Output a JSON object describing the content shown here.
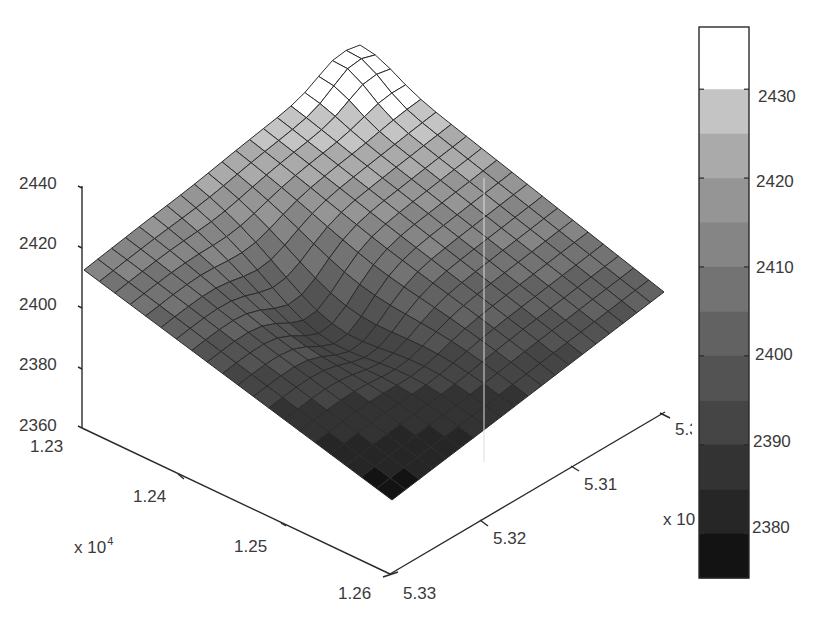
{
  "chart_data": {
    "type": "surface3d",
    "title": "",
    "xlabel": "",
    "ylabel": "",
    "zlabel": "",
    "x_axis": {
      "ticks": [
        "1.23",
        "1.24",
        "1.25",
        "1.26"
      ],
      "multiplier": "x 10",
      "exponent": "4",
      "range": [
        12300,
        12600
      ]
    },
    "y_axis": {
      "ticks": [
        "5.3",
        "5.31",
        "5.32",
        "5.33"
      ],
      "multiplier": "x 10",
      "exponent": "",
      "range": [
        5.3,
        5.33
      ]
    },
    "z_axis": {
      "ticks": [
        "2360",
        "2380",
        "2400",
        "2420",
        "2440"
      ],
      "range": [
        2360,
        2440
      ]
    },
    "colorbar": {
      "ticks": [
        "2430",
        "2420",
        "2410",
        "2400",
        "2390",
        "2380"
      ],
      "range": [
        2375,
        2437
      ],
      "bands": [
        {
          "from": 2430,
          "to": 2437,
          "color": "#ffffff"
        },
        {
          "from": 2425,
          "to": 2430,
          "color": "#c4c4c4"
        },
        {
          "from": 2420,
          "to": 2425,
          "color": "#aaaaaa"
        },
        {
          "from": 2415,
          "to": 2420,
          "color": "#959595"
        },
        {
          "from": 2410,
          "to": 2415,
          "color": "#858585"
        },
        {
          "from": 2405,
          "to": 2410,
          "color": "#737373"
        },
        {
          "from": 2400,
          "to": 2405,
          "color": "#626262"
        },
        {
          "from": 2395,
          "to": 2400,
          "color": "#535353"
        },
        {
          "from": 2390,
          "to": 2395,
          "color": "#454545"
        },
        {
          "from": 2385,
          "to": 2390,
          "color": "#333333"
        },
        {
          "from": 2380,
          "to": 2385,
          "color": "#262626"
        },
        {
          "from": 2375,
          "to": 2380,
          "color": "#131313"
        }
      ]
    },
    "surface_summary": {
      "grid": "approx 20 x 20 mesh",
      "peak": {
        "x": 12300,
        "y": 5.3,
        "z": 2437
      },
      "left_corner": {
        "x": 12300,
        "y": 5.33,
        "z": 2411
      },
      "right_corner": {
        "x": 12600,
        "y": 5.3,
        "z": 2402
      },
      "near_corner": {
        "x": 12600,
        "y": 5.33,
        "z": 2376
      },
      "trough": {
        "approx_z": 2378,
        "location": "central front ridge/valley"
      }
    },
    "grid": false,
    "legend": "colorbar right"
  }
}
